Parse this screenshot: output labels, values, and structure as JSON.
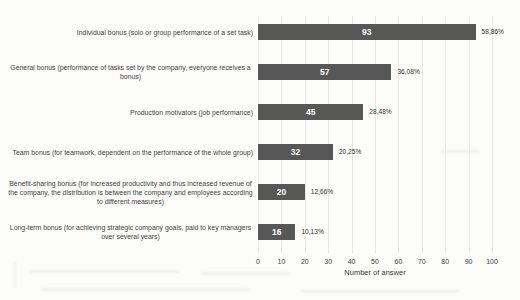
{
  "chart_data": {
    "type": "bar",
    "orientation": "horizontal",
    "title": "",
    "xlabel": "Number of answer",
    "ylabel": "",
    "xlim": [
      0,
      100
    ],
    "xticks": [
      0,
      10,
      20,
      30,
      40,
      50,
      60,
      70,
      80,
      90,
      100
    ],
    "grid": true,
    "bar_color": "#575757",
    "value_label_color": "#ffffff",
    "categories": [
      "Individual bonus (solo or group performance of a set task)",
      "General bonus (performance of tasks set by the company, everyone receives a bonus)",
      "Production motivators (job performance)",
      "Team bonus (for teamwork, dependent on the performance of the whole group)",
      "Benefit-sharing bonus (for increased productivity and thus increased revenue of the company, the distribution is between the company and employees according to different measures)",
      "Long-term bonus (for achieving strategic company goals, paid to key managers over several years)"
    ],
    "values": [
      93,
      57,
      45,
      32,
      20,
      16
    ],
    "percent_labels": [
      "58,86%",
      "36,08%",
      "28,48%",
      "20,25%",
      "12,66%",
      "10,13%"
    ]
  }
}
